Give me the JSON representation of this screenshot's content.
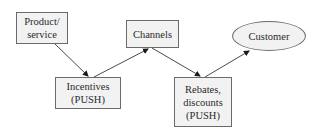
{
  "diagram": {
    "type": "flow",
    "colors": {
      "node_fill": "#f2f2f2",
      "node_border": "#6a6a6a",
      "edge": "#4a4a4a",
      "text": "#2a2a2a"
    },
    "nodes": {
      "product": {
        "shape": "rect",
        "lines": [
          "Product/",
          "service"
        ]
      },
      "channels": {
        "shape": "rect",
        "lines": [
          "Channels"
        ]
      },
      "customer": {
        "shape": "ellipse",
        "lines": [
          "Customer"
        ]
      },
      "incentives": {
        "shape": "rect",
        "lines": [
          "Incentives",
          "(PUSH)"
        ]
      },
      "rebates": {
        "shape": "rect",
        "lines": [
          "Rebates,",
          "discounts",
          "(PUSH)"
        ]
      }
    },
    "edges": [
      {
        "from": "Product/service",
        "to": "Incentives (PUSH)"
      },
      {
        "from": "Incentives (PUSH)",
        "to": "Channels"
      },
      {
        "from": "Channels",
        "to": "Rebates, discounts (PUSH)"
      },
      {
        "from": "Rebates, discounts (PUSH)",
        "to": "Customer"
      }
    ]
  }
}
